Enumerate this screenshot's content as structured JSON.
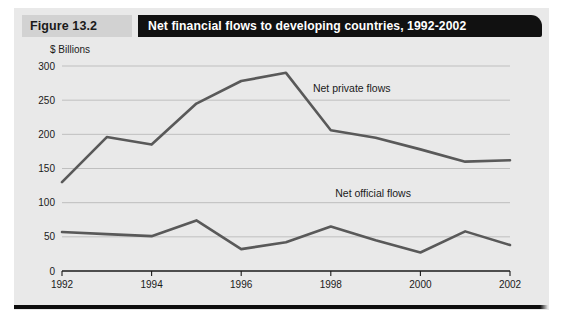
{
  "figure": {
    "tag": "Figure 13.2",
    "title": "Net financial flows to developing countries, 1992-2002",
    "units_label": "$ Billions"
  },
  "colors": {
    "panel_background": "#e9e9e9",
    "title_bar": "#111111",
    "tag_background": "#d2d2d2",
    "line": "#595959",
    "gridline": "#b4b4b4",
    "axis": "#1a1a1a"
  },
  "chart_data": {
    "type": "line",
    "title": "Net financial flows to developing countries, 1992-2002",
    "xlabel": "",
    "ylabel": "$ Billions",
    "ylim": [
      0,
      300
    ],
    "xlim": [
      1992,
      2002
    ],
    "yticks": [
      "0",
      "50",
      "100",
      "150",
      "200",
      "250",
      "300"
    ],
    "ytick_values": [
      0,
      50,
      100,
      150,
      200,
      250,
      300
    ],
    "xticks": [
      "1992",
      "1994",
      "1996",
      "1998",
      "2000",
      "2002"
    ],
    "xtick_values": [
      1992,
      1994,
      1996,
      1998,
      2000,
      2002
    ],
    "grid": true,
    "legend_position": "inline-annotation",
    "x": [
      1992,
      1993,
      1994,
      1995,
      1996,
      1997,
      1998,
      1999,
      2000,
      2001,
      2002
    ],
    "series": [
      {
        "name": "Net private flows",
        "values": [
          130,
          196,
          185,
          245,
          278,
          290,
          206,
          195,
          178,
          160,
          162
        ]
      },
      {
        "name": "Net official flows",
        "values": [
          57,
          54,
          51,
          74,
          32,
          42,
          65,
          45,
          27,
          58,
          38
        ]
      }
    ],
    "annotations": [
      {
        "text": "Net private flows",
        "x": 1997.6,
        "y": 262
      },
      {
        "text": "Net official flows",
        "x": 1998.1,
        "y": 108
      }
    ]
  }
}
